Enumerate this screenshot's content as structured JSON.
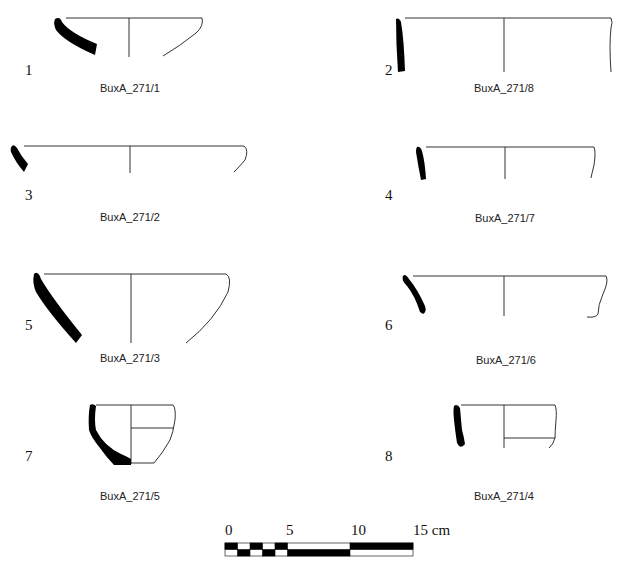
{
  "figure": {
    "sherds": [
      {
        "number": "1",
        "label": "BuxA_271/1"
      },
      {
        "number": "2",
        "label": "BuxA_271/8"
      },
      {
        "number": "3",
        "label": "BuxA_271/2"
      },
      {
        "number": "4",
        "label": "BuxA_271/7"
      },
      {
        "number": "5",
        "label": "BuxA_271/3"
      },
      {
        "number": "6",
        "label": "BuxA_271/6"
      },
      {
        "number": "7",
        "label": "BuxA_271/5"
      },
      {
        "number": "8",
        "label": "BuxA_271/4"
      }
    ],
    "scale_bar": {
      "ticks": [
        "0",
        "5",
        "10",
        "15 cm"
      ]
    }
  }
}
